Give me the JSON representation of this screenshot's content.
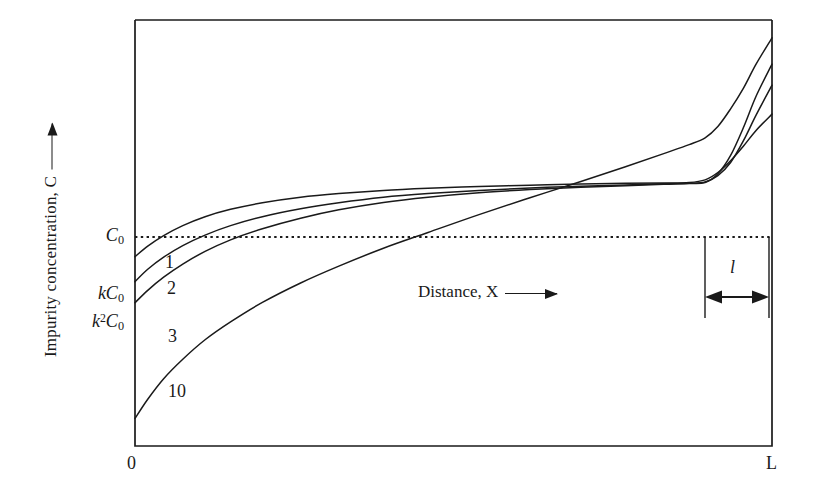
{
  "figure": {
    "background_color": "#ffffff",
    "ink_color": "#1a1a1a"
  },
  "axes": {
    "y_title_text": "Impurity concentration, C",
    "y_title_arrow_icon": "up-arrow-icon",
    "x_title_text": "Distance, X",
    "x_title_arrow_icon": "right-arrow-icon",
    "x_tick_origin": "0",
    "x_tick_end": "L",
    "y_ticks": [
      {
        "id": "c0",
        "html": "C<sub>0</sub>",
        "plain": "C0"
      },
      {
        "id": "kc0",
        "html": "kC<sub>0</sub>",
        "plain": "kC0"
      },
      {
        "id": "k2c0",
        "html": "k<sup>2</sup>C<sub>0</sub>",
        "plain": "k2C0"
      }
    ]
  },
  "annotations": {
    "zone_length_label": "l",
    "zone_length_arrow_icon": "double-headed-arrow-icon",
    "c0_reference_line": "dotted"
  },
  "curve_labels": [
    {
      "label": "1"
    },
    {
      "label": "2"
    },
    {
      "label": "3"
    },
    {
      "label": "10"
    }
  ],
  "chart_data": {
    "type": "line",
    "title": "",
    "subtitle": "",
    "xlabel": "Distance, X",
    "ylabel": "Impurity concentration, C",
    "xlim": [
      0,
      1
    ],
    "ylim": [
      0,
      1.62
    ],
    "grid": false,
    "legend": "inline-curve-labels",
    "x_tick_labels": [
      "0",
      "L"
    ],
    "x_tick_values": [
      0,
      1
    ],
    "y_tick_labels": [
      "C0",
      "kC0",
      "k2C0"
    ],
    "y_tick_values": [
      1.0,
      0.72,
      0.56
    ],
    "reference_lines": [
      {
        "name": "C0",
        "orientation": "horizontal",
        "value": 1.0,
        "style": "dotted",
        "from_x": 0.0,
        "to_x": 1.0
      }
    ],
    "annotations": [
      {
        "text": "l",
        "type": "span-arrow",
        "from_x": 0.895,
        "to_x": 1.0,
        "y": 0.73,
        "bracket_top_y": 1.0,
        "bracket_bottom_y": 0.52
      }
    ],
    "series": [
      {
        "name": "1",
        "label": "1",
        "description": "after 1 zone pass",
        "x": [
          0.0,
          0.02,
          0.045,
          0.075,
          0.11,
          0.15,
          0.2,
          0.26,
          0.32,
          0.39,
          0.46,
          0.54,
          0.62,
          0.7,
          0.77,
          0.83,
          0.87,
          0.895,
          0.915,
          0.935,
          0.955,
          0.975,
          1.0
        ],
        "y": [
          0.72,
          0.76,
          0.8,
          0.838,
          0.872,
          0.9,
          0.925,
          0.946,
          0.96,
          0.972,
          0.98,
          0.987,
          0.992,
          0.996,
          0.999,
          1.0,
          1.002,
          1.012,
          1.04,
          1.085,
          1.14,
          1.2,
          1.262
        ]
      },
      {
        "name": "2",
        "label": "2",
        "description": "after 2 zone passes",
        "x": [
          0.0,
          0.02,
          0.045,
          0.075,
          0.11,
          0.15,
          0.2,
          0.26,
          0.32,
          0.39,
          0.46,
          0.54,
          0.62,
          0.7,
          0.77,
          0.83,
          0.87,
          0.895,
          0.915,
          0.935,
          0.955,
          0.975,
          1.0
        ],
        "y": [
          0.625,
          0.672,
          0.718,
          0.762,
          0.802,
          0.838,
          0.872,
          0.902,
          0.925,
          0.946,
          0.96,
          0.972,
          0.981,
          0.988,
          0.993,
          0.997,
          0.999,
          1.004,
          1.028,
          1.078,
          1.16,
          1.258,
          1.372
        ]
      },
      {
        "name": "3",
        "label": "3",
        "description": "after 3 zone passes",
        "x": [
          0.0,
          0.02,
          0.045,
          0.075,
          0.11,
          0.15,
          0.2,
          0.26,
          0.32,
          0.39,
          0.46,
          0.54,
          0.62,
          0.7,
          0.77,
          0.83,
          0.87,
          0.895,
          0.915,
          0.935,
          0.955,
          0.975,
          1.0
        ],
        "y": [
          0.545,
          0.592,
          0.642,
          0.692,
          0.74,
          0.784,
          0.826,
          0.866,
          0.898,
          0.926,
          0.946,
          0.963,
          0.975,
          0.984,
          0.99,
          0.995,
          0.998,
          1.002,
          1.035,
          1.105,
          1.21,
          1.33,
          1.452
        ]
      },
      {
        "name": "10",
        "label": "10",
        "description": "after 10 zone passes",
        "x": [
          0.0,
          0.02,
          0.045,
          0.075,
          0.11,
          0.15,
          0.2,
          0.26,
          0.32,
          0.39,
          0.46,
          0.54,
          0.62,
          0.7,
          0.77,
          0.83,
          0.87,
          0.895,
          0.915,
          0.935,
          0.955,
          0.975,
          1.0
        ],
        "y": [
          0.105,
          0.178,
          0.256,
          0.33,
          0.404,
          0.472,
          0.546,
          0.62,
          0.684,
          0.752,
          0.812,
          0.88,
          0.944,
          1.006,
          1.062,
          1.112,
          1.146,
          1.172,
          1.215,
          1.282,
          1.36,
          1.452,
          1.552
        ]
      }
    ]
  }
}
